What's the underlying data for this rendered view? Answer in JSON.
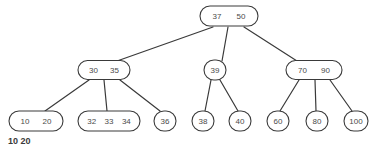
{
  "figure": {
    "background_color": "#ffffff",
    "stroke_color": "#3a3a3a",
    "text_color": "#4a4a4a",
    "width": 375,
    "height": 147
  },
  "caption": {
    "text": "10 20",
    "x": 8,
    "y": 144,
    "clipped": true
  },
  "chart_data": {
    "type": "diagram",
    "title": "",
    "structure": "b-tree",
    "levels": 3,
    "nodes": [
      {
        "id": "root",
        "keys": [
          "37",
          "50"
        ],
        "level": 0,
        "cx": 229,
        "cy": 16,
        "rx": 29,
        "ry": 10,
        "shape": "stadium"
      },
      {
        "id": "n-30-35",
        "keys": [
          "30",
          "35"
        ],
        "level": 1,
        "cx": 104,
        "cy": 70,
        "rx": 26,
        "ry": 9.5,
        "shape": "stadium"
      },
      {
        "id": "n-39",
        "keys": [
          "39"
        ],
        "level": 1,
        "cx": 215,
        "cy": 70,
        "rx": 11,
        "ry": 10,
        "shape": "circle"
      },
      {
        "id": "n-70-90",
        "keys": [
          "70",
          "90"
        ],
        "level": 1,
        "cx": 314,
        "cy": 70,
        "rx": 28,
        "ry": 9.5,
        "shape": "stadium"
      },
      {
        "id": "n-10-20",
        "keys": [
          "10",
          "20"
        ],
        "level": 2,
        "cx": 36,
        "cy": 121,
        "rx": 27,
        "ry": 10,
        "shape": "stadium"
      },
      {
        "id": "n-32-33-34",
        "keys": [
          "32",
          "33",
          "34"
        ],
        "level": 2,
        "cx": 109,
        "cy": 121,
        "rx": 31,
        "ry": 10,
        "shape": "stadium"
      },
      {
        "id": "n-36",
        "keys": [
          "36"
        ],
        "level": 2,
        "cx": 165,
        "cy": 121,
        "rx": 11,
        "ry": 10,
        "shape": "circle"
      },
      {
        "id": "n-38",
        "keys": [
          "38"
        ],
        "level": 2,
        "cx": 203,
        "cy": 121,
        "rx": 11,
        "ry": 10,
        "shape": "circle"
      },
      {
        "id": "n-40",
        "keys": [
          "40"
        ],
        "level": 2,
        "cx": 240,
        "cy": 121,
        "rx": 11,
        "ry": 10,
        "shape": "circle"
      },
      {
        "id": "n-60",
        "keys": [
          "60"
        ],
        "level": 2,
        "cx": 278,
        "cy": 121,
        "rx": 11,
        "ry": 10,
        "shape": "circle"
      },
      {
        "id": "n-80",
        "keys": [
          "80"
        ],
        "level": 2,
        "cx": 317,
        "cy": 121,
        "rx": 11,
        "ry": 10,
        "shape": "circle"
      },
      {
        "id": "n-100",
        "keys": [
          "100"
        ],
        "level": 2,
        "cx": 356,
        "cy": 121,
        "rx": 12,
        "ry": 10,
        "shape": "circle"
      }
    ],
    "edges": [
      {
        "from": "root",
        "to": "n-30-35",
        "x1": 213,
        "y1": 27,
        "x2": 117,
        "y2": 61
      },
      {
        "from": "root",
        "to": "n-39",
        "x1": 228,
        "y1": 27,
        "x2": 222,
        "y2": 61
      },
      {
        "from": "root",
        "to": "n-70-90",
        "x1": 244,
        "y1": 27,
        "x2": 297,
        "y2": 61
      },
      {
        "from": "n-30-35",
        "to": "n-10-20",
        "x1": 89,
        "y1": 80,
        "x2": 45,
        "y2": 111
      },
      {
        "from": "n-30-35",
        "to": "n-32-33-34",
        "x1": 104,
        "y1": 80,
        "x2": 107,
        "y2": 111
      },
      {
        "from": "n-30-35",
        "to": "n-36",
        "x1": 120,
        "y1": 80,
        "x2": 160,
        "y2": 111
      },
      {
        "from": "n-39",
        "to": "n-38",
        "x1": 211,
        "y1": 80,
        "x2": 205,
        "y2": 111
      },
      {
        "from": "n-39",
        "to": "n-40",
        "x1": 220,
        "y1": 80,
        "x2": 238,
        "y2": 111
      },
      {
        "from": "n-70-90",
        "to": "n-60",
        "x1": 299,
        "y1": 80,
        "x2": 280,
        "y2": 111
      },
      {
        "from": "n-70-90",
        "to": "n-80",
        "x1": 315,
        "y1": 80,
        "x2": 316,
        "y2": 111
      },
      {
        "from": "n-70-90",
        "to": "n-100",
        "x1": 330,
        "y1": 80,
        "x2": 352,
        "y2": 111
      }
    ]
  }
}
